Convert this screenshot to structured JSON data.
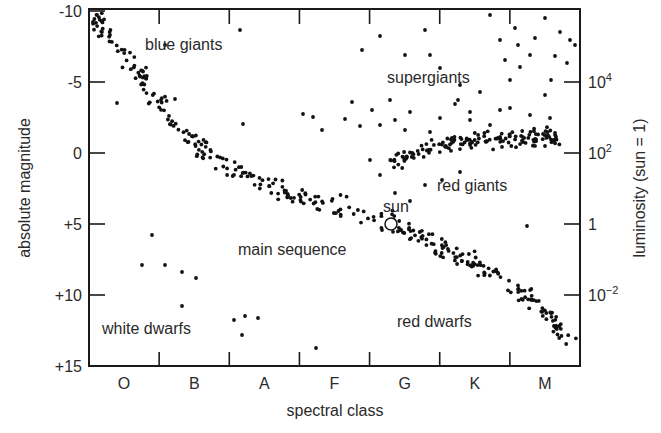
{
  "chart_data": {
    "type": "scatter",
    "xlabel": "spectral class",
    "ylabel": "absolute magnitude",
    "y2label": "luminosity (sun = 1)",
    "x_categories": [
      "O",
      "B",
      "A",
      "F",
      "G",
      "K",
      "M"
    ],
    "y_ticks": [
      "-10",
      "-5",
      "0",
      "+5",
      "+10",
      "+15"
    ],
    "y_tick_values": [
      -10,
      -5,
      0,
      5,
      10,
      15
    ],
    "y2_ticks": [
      {
        "base": "10",
        "exp": "4",
        "magnitude": -5
      },
      {
        "base": "10",
        "exp": "2",
        "magnitude": 0
      },
      {
        "base": "1",
        "exp": "",
        "magnitude": 5
      },
      {
        "base": "10",
        "exp": "−2",
        "magnitude": 10
      }
    ],
    "ylim": [
      -10.5,
      15
    ],
    "y_inverted": true,
    "grid": false,
    "regions": [
      {
        "label": "blue giants",
        "x_class": "B",
        "magnitude": -8.5
      },
      {
        "label": "supergiants",
        "x_class": "G-K",
        "magnitude": -4.5
      },
      {
        "label": "red giants",
        "x_class": "G-K",
        "magnitude": 2
      },
      {
        "label": "sun",
        "x_class": "G",
        "magnitude": 4
      },
      {
        "label": "main sequence",
        "x_class": "F-G",
        "magnitude": 6.5
      },
      {
        "label": "white dwarfs",
        "x_class": "O-B",
        "magnitude": 12
      },
      {
        "label": "red dwarfs",
        "x_class": "K",
        "magnitude": 11.5
      }
    ],
    "sun_point": {
      "x_class": "G",
      "magnitude": 4.8
    },
    "bands": [
      {
        "name": "main-sequence",
        "count": 330,
        "path": [
          [
            93,
            18
          ],
          [
            130,
            60
          ],
          [
            165,
            110
          ],
          [
            200,
            150
          ],
          [
            250,
            180
          ],
          [
            300,
            198
          ],
          [
            350,
            210
          ],
          [
            390,
            222
          ],
          [
            430,
            240
          ],
          [
            470,
            262
          ],
          [
            510,
            285
          ],
          [
            545,
            310
          ],
          [
            570,
            345
          ]
        ],
        "spread": 9
      },
      {
        "name": "red-giant-branch",
        "count": 150,
        "path": [
          [
            385,
            165
          ],
          [
            420,
            150
          ],
          [
            470,
            140
          ],
          [
            520,
            138
          ],
          [
            560,
            138
          ]
        ],
        "spread": 8
      }
    ],
    "scatter_points": {
      "supergiants": [
        [
          110,
          35
        ],
        [
          165,
          45
        ],
        [
          240,
          30
        ],
        [
          303,
          114
        ],
        [
          345,
          119
        ],
        [
          380,
          36
        ],
        [
          390,
          100
        ],
        [
          405,
          55
        ],
        [
          425,
          30
        ],
        [
          430,
          55
        ],
        [
          440,
          68
        ],
        [
          460,
          85
        ],
        [
          458,
          100
        ],
        [
          470,
          112
        ],
        [
          480,
          92
        ],
        [
          490,
          15
        ],
        [
          500,
          40
        ],
        [
          505,
          60
        ],
        [
          510,
          80
        ],
        [
          515,
          28
        ],
        [
          518,
          45
        ],
        [
          520,
          67
        ],
        [
          530,
          55
        ],
        [
          535,
          38
        ],
        [
          545,
          18
        ],
        [
          551,
          80
        ],
        [
          545,
          95
        ],
        [
          555,
          56
        ],
        [
          560,
          32
        ],
        [
          567,
          63
        ],
        [
          570,
          40
        ],
        [
          575,
          45
        ],
        [
          352,
          102
        ],
        [
          322,
          130
        ],
        [
          360,
          126
        ],
        [
          372,
          110
        ],
        [
          380,
          125
        ],
        [
          395,
          120
        ],
        [
          405,
          130
        ],
        [
          410,
          112
        ],
        [
          430,
          132
        ],
        [
          440,
          118
        ],
        [
          455,
          104
        ],
        [
          470,
          120
        ],
        [
          490,
          125
        ],
        [
          500,
          110
        ],
        [
          510,
          108
        ],
        [
          530,
          115
        ],
        [
          550,
          118
        ],
        [
          370,
          160
        ],
        [
          380,
          175
        ],
        [
          395,
          193
        ],
        [
          410,
          201
        ],
        [
          425,
          185
        ],
        [
          442,
          180
        ],
        [
          460,
          172
        ]
      ],
      "white_dwarfs": [
        [
          152,
          235
        ],
        [
          142,
          265
        ],
        [
          165,
          265
        ],
        [
          182,
          272
        ],
        [
          196,
          278
        ],
        [
          182,
          306
        ],
        [
          234,
          320
        ],
        [
          245,
          316
        ],
        [
          258,
          318
        ],
        [
          242,
          335
        ],
        [
          316,
          348
        ]
      ],
      "outliers": [
        [
          117,
          103
        ],
        [
          243,
          124
        ],
        [
          175,
          99
        ],
        [
          313,
          117
        ],
        [
          362,
          50
        ],
        [
          498,
          273
        ],
        [
          527,
          226
        ]
      ]
    }
  }
}
